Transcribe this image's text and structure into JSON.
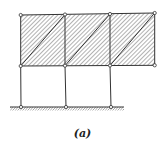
{
  "figure": {
    "caption": "(a)",
    "colors": {
      "line": "#333333",
      "hatch": "#555555",
      "node_fill": "#ffffff"
    }
  },
  "structure": {
    "nodes": [
      {
        "id": "T1",
        "x": 20.7,
        "y": 15
      },
      {
        "id": "T2",
        "x": 65,
        "y": 14.5
      },
      {
        "id": "T3",
        "x": 110,
        "y": 14
      },
      {
        "id": "T4",
        "x": 154.7,
        "y": 13
      },
      {
        "id": "M1",
        "x": 20.7,
        "y": 66
      },
      {
        "id": "M2",
        "x": 65,
        "y": 65.7
      },
      {
        "id": "M3",
        "x": 110,
        "y": 65.5
      },
      {
        "id": "M4",
        "x": 154.7,
        "y": 65.3
      },
      {
        "id": "G1",
        "x": 21,
        "y": 107
      },
      {
        "id": "G2",
        "x": 66,
        "y": 107
      },
      {
        "id": "G3",
        "x": 111,
        "y": 107
      }
    ],
    "panels": 3,
    "ground": {
      "x1": 10,
      "x2": 124,
      "y": 107
    }
  }
}
